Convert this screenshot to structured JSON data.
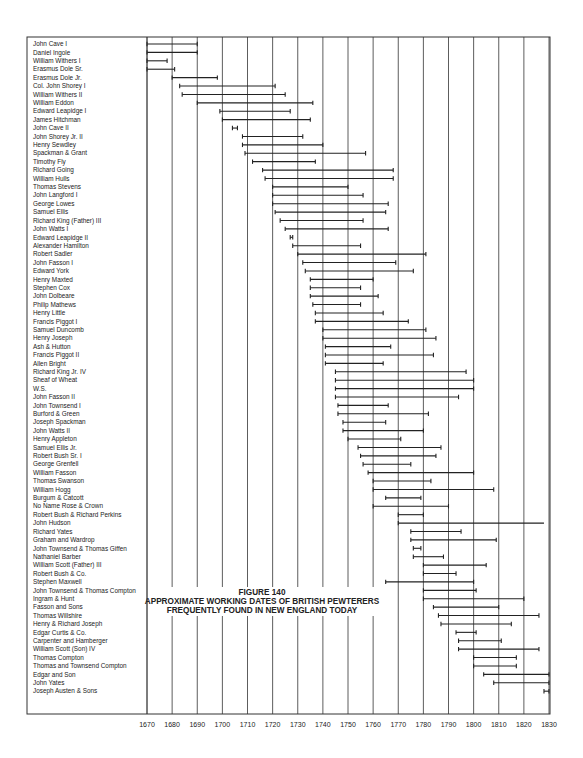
{
  "chart_data": {
    "type": "gantt",
    "title": "FIGURE 140",
    "subtitle_lines": [
      "APPROXIMATE WORKING DATES OF BRITISH PEWTERERS",
      "FREQUENTLY FOUND IN NEW ENGLAND TODAY"
    ],
    "xlabel": "",
    "ylabel": "",
    "xlim": [
      1670,
      1830
    ],
    "x_ticks": [
      1670,
      1680,
      1690,
      1700,
      1710,
      1720,
      1730,
      1740,
      1750,
      1760,
      1770,
      1780,
      1790,
      1800,
      1810,
      1820,
      1830
    ],
    "grid": true,
    "rows": [
      {
        "name": "John Cave I",
        "start": 1670,
        "end": 1690
      },
      {
        "name": "Daniel Ingole",
        "start": 1670,
        "end": 1690
      },
      {
        "name": "William Withers I",
        "start": 1670,
        "end": 1678
      },
      {
        "name": "Erasmus Dole Sr.",
        "start": 1670,
        "end": 1681
      },
      {
        "name": "Erasmus Dole Jr.",
        "start": 1680,
        "end": 1698
      },
      {
        "name": "Col. John Shorey I",
        "start": 1683,
        "end": 1721
      },
      {
        "name": "William Withers II",
        "start": 1684,
        "end": 1725
      },
      {
        "name": "William Eddon",
        "start": 1690,
        "end": 1736
      },
      {
        "name": "Edward Leapidge I",
        "start": 1699,
        "end": 1727
      },
      {
        "name": "James Hitchman",
        "start": 1700,
        "end": 1735
      },
      {
        "name": "John Cave II",
        "start": 1704,
        "end": 1706
      },
      {
        "name": "John Shorey Jr. II",
        "start": 1708,
        "end": 1732
      },
      {
        "name": "Henry Sewdley",
        "start": 1708,
        "end": 1740
      },
      {
        "name": "Spackman & Grant",
        "start": 1709,
        "end": 1757
      },
      {
        "name": "Timothy Fly",
        "start": 1712,
        "end": 1737
      },
      {
        "name": "Richard Going",
        "start": 1716,
        "end": 1768
      },
      {
        "name": "William Hulls",
        "start": 1717,
        "end": 1768
      },
      {
        "name": "Thomas Stevens",
        "start": 1720,
        "end": 1750
      },
      {
        "name": "John Langford I",
        "start": 1720,
        "end": 1756
      },
      {
        "name": "George Lowes",
        "start": 1720,
        "end": 1766
      },
      {
        "name": "Samuel Ellis",
        "start": 1721,
        "end": 1765
      },
      {
        "name": "Richard King (Father) III",
        "start": 1723,
        "end": 1756
      },
      {
        "name": "John Watts I",
        "start": 1725,
        "end": 1766
      },
      {
        "name": "Edward Leapidge II",
        "start": 1727,
        "end": 1728
      },
      {
        "name": "Alexander Hamilton",
        "start": 1728,
        "end": 1755
      },
      {
        "name": "Robert Sadler",
        "start": 1730,
        "end": 1781
      },
      {
        "name": "John Fasson I",
        "start": 1732,
        "end": 1769
      },
      {
        "name": "Edward York",
        "start": 1733,
        "end": 1776
      },
      {
        "name": "Henry Maxted",
        "start": 1735,
        "end": 1760
      },
      {
        "name": "Stephen Cox",
        "start": 1735,
        "end": 1755
      },
      {
        "name": "John Dolbeare",
        "start": 1735,
        "end": 1762
      },
      {
        "name": "Philip Mathews",
        "start": 1736,
        "end": 1755
      },
      {
        "name": "Henry Little",
        "start": 1737,
        "end": 1764
      },
      {
        "name": "Francis Piggot I",
        "start": 1737,
        "end": 1774
      },
      {
        "name": "Samuel Duncomb",
        "start": 1740,
        "end": 1781
      },
      {
        "name": "Henry Joseph",
        "start": 1740,
        "end": 1785
      },
      {
        "name": "Ash & Hutton",
        "start": 1741,
        "end": 1767
      },
      {
        "name": "Francis Piggot II",
        "start": 1741,
        "end": 1784
      },
      {
        "name": "Allen Bright",
        "start": 1741,
        "end": 1764
      },
      {
        "name": "Richard King Jr. IV",
        "start": 1745,
        "end": 1797
      },
      {
        "name": "Sheaf of Wheat",
        "start": 1745,
        "end": 1800
      },
      {
        "name": "W.S.",
        "start": 1745,
        "end": 1800
      },
      {
        "name": "John Fasson II",
        "start": 1745,
        "end": 1794
      },
      {
        "name": "John Townsend I",
        "start": 1746,
        "end": 1766
      },
      {
        "name": "Burford & Green",
        "start": 1746,
        "end": 1782
      },
      {
        "name": "Joseph Spackman",
        "start": 1748,
        "end": 1765
      },
      {
        "name": "John Watts II",
        "start": 1748,
        "end": 1780
      },
      {
        "name": "Henry Appleton",
        "start": 1750,
        "end": 1771
      },
      {
        "name": "Samuel Ellis Jr.",
        "start": 1754,
        "end": 1787
      },
      {
        "name": "Robert Bush Sr. I",
        "start": 1755,
        "end": 1785
      },
      {
        "name": "George Grenfell",
        "start": 1756,
        "end": 1775
      },
      {
        "name": "William Fasson",
        "start": 1758,
        "end": 1800
      },
      {
        "name": "Thomas Swanson",
        "start": 1760,
        "end": 1783
      },
      {
        "name": "William Hogg",
        "start": 1760,
        "end": 1808
      },
      {
        "name": "Burgum & Catcott",
        "start": 1765,
        "end": 1779
      },
      {
        "name": "No Name Rose & Crown",
        "start": 1760,
        "end": 1790
      },
      {
        "name": "Robert Bush & Richard Perkins",
        "start": 1770,
        "end": 1780
      },
      {
        "name": "John Hudson",
        "start": 1770,
        "end": 1828,
        "open_end": true
      },
      {
        "name": "Richard Yates",
        "start": 1775,
        "end": 1795
      },
      {
        "name": "Graham and Wardrop",
        "start": 1775,
        "end": 1809
      },
      {
        "name": "John Townsend & Thomas Giffen",
        "start": 1776,
        "end": 1779
      },
      {
        "name": "Nathaniel Barber",
        "start": 1776,
        "end": 1788
      },
      {
        "name": "William Scott (Father) III",
        "start": 1780,
        "end": 1805
      },
      {
        "name": "Robert Bush & Co.",
        "start": 1780,
        "end": 1793
      },
      {
        "name": "Stephen Maxwell",
        "start": 1765,
        "end": 1800
      },
      {
        "name": "John Townsend & Thomas Compton",
        "start": 1780,
        "end": 1801
      },
      {
        "name": "Ingram & Hunt",
        "start": 1780,
        "end": 1820
      },
      {
        "name": "Fasson and Sons",
        "start": 1784,
        "end": 1810
      },
      {
        "name": "Thomas Willshire",
        "start": 1786,
        "end": 1826
      },
      {
        "name": "Henry & Richard Joseph",
        "start": 1787,
        "end": 1815
      },
      {
        "name": "Edgar Curtis & Co.",
        "start": 1793,
        "end": 1801
      },
      {
        "name": "Carpenter and Hamberger",
        "start": 1794,
        "end": 1811
      },
      {
        "name": "William Scott (Son) IV",
        "start": 1794,
        "end": 1826
      },
      {
        "name": "Thomas Compton",
        "start": 1800,
        "end": 1817
      },
      {
        "name": "Thomas and Townsend Compton",
        "start": 1800,
        "end": 1817
      },
      {
        "name": "Edgar and Son",
        "start": 1804,
        "end": 1830
      },
      {
        "name": "John Yates",
        "start": 1808,
        "end": 1830
      },
      {
        "name": "Joseph Austen & Sons",
        "start": 1828,
        "end": 1830
      }
    ]
  },
  "layout": {
    "frame_left": 27,
    "divider_x": 147,
    "frame_right": 550,
    "frame_top": 37,
    "frame_bottom": 714,
    "x0": 147,
    "px_per_year": 2.5125,
    "row_top": 44,
    "row_step": 8.405,
    "title_x": 262,
    "title_y": 595
  },
  "colors": {
    "ink": "#222222",
    "background": "#ffffff"
  }
}
